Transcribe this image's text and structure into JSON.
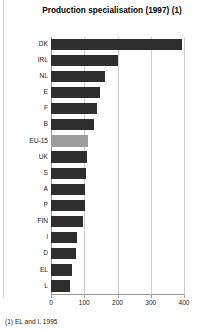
{
  "chart_data": {
    "type": "bar",
    "orientation": "horizontal",
    "title": "Production specialisation (1997) (1)",
    "footnote": "(1) EL and I, 1995",
    "xlabel": "",
    "ylabel": "",
    "xlim": [
      0,
      400
    ],
    "xticks": [
      0,
      100,
      200,
      300,
      400
    ],
    "xtick_labels": [
      "0",
      "100",
      "200",
      "300",
      "400"
    ],
    "grid": true,
    "grid_axis": "x",
    "legend": false,
    "categories": [
      "DK",
      "IRL",
      "NL",
      "E",
      "F",
      "B",
      "EU-15",
      "UK",
      "S",
      "A",
      "P",
      "FIN",
      "I",
      "D",
      "EL",
      "L"
    ],
    "values": [
      395,
      202,
      163,
      148,
      139,
      130,
      112,
      108,
      105,
      103,
      101,
      97,
      79,
      76,
      64,
      57
    ],
    "highlight_category": "EU-15",
    "colors": {
      "bar": "#2e2e2e",
      "bar_highlight": "#9d9d9d",
      "grid": "#cfcfcf",
      "axis": "#9a9a9a",
      "text": "#1a1a1a",
      "background": "#ffffff"
    }
  }
}
